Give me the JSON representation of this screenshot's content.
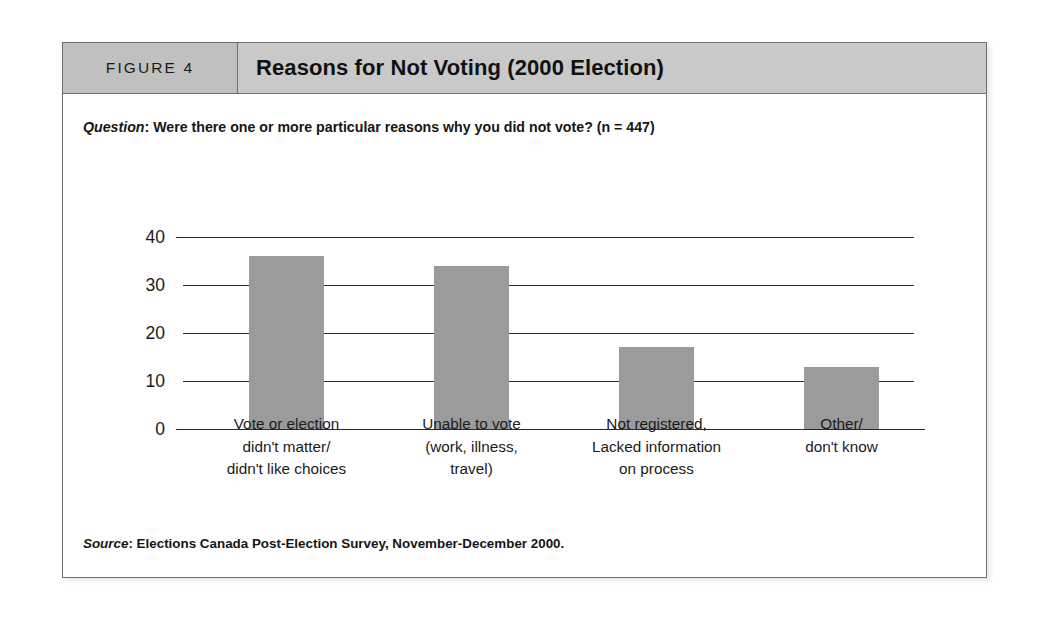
{
  "figure": {
    "number_label": "FIGURE 4",
    "title": "Reasons for Not Voting (2000 Election)",
    "question_prefix": "Question",
    "question_separator": ": ",
    "question_text": "Were there one or more particular reasons why you did not vote? (n = 447)",
    "source_prefix": "Source",
    "source_separator": ": ",
    "source_text": "Elections Canada Post-Election Survey, November-December 2000."
  },
  "colors": {
    "bar_fill": "#9b9b9b",
    "header_band": "#c9c9c9",
    "header_number_box": "#c0c0c0",
    "frame_border": "#6f7074",
    "axis_line": "#2a2a2a",
    "page_background": "#ffffff",
    "text": "#1b1b1b"
  },
  "chart_data": {
    "type": "bar",
    "title": "Reasons for Not Voting (2000 Election)",
    "xlabel": "",
    "ylabel": "",
    "ylim": [
      0,
      40
    ],
    "yticks": [
      0,
      10,
      20,
      30,
      40
    ],
    "ytick_labels": [
      "0",
      "10",
      "20",
      "30",
      "40"
    ],
    "grid": true,
    "legend": false,
    "units": "percent",
    "sample_size": 447,
    "categories": [
      "Vote or election didn't matter/ didn't like choices",
      "Unable to vote (work, illness, travel)",
      "Not registered, Lacked information on process",
      "Other/ don't know"
    ],
    "category_lines": [
      [
        "Vote or election",
        "didn't matter/",
        "didn't like choices"
      ],
      [
        "Unable to vote",
        "(work, illness,",
        "travel)"
      ],
      [
        "Not registered,",
        "Lacked information",
        "on process"
      ],
      [
        "Other/",
        "don't know"
      ]
    ],
    "values": [
      36,
      34,
      17,
      13
    ]
  }
}
